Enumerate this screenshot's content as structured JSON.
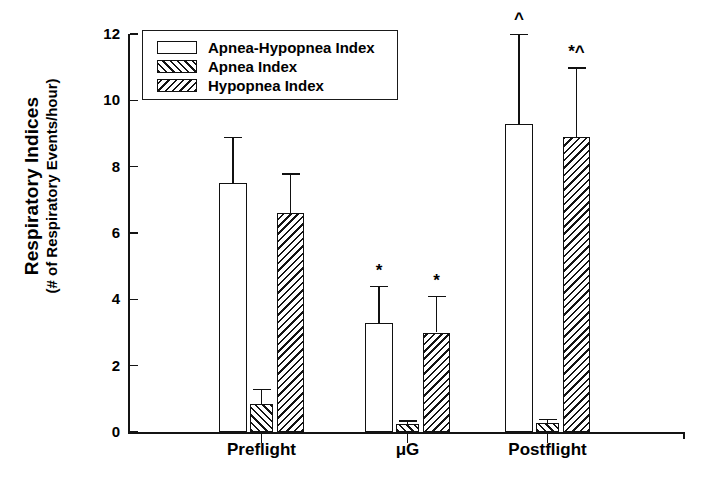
{
  "chart_data": {
    "type": "bar",
    "title": "",
    "xlabel": "",
    "ylabel": "Respiratory Indices",
    "ylabel_sub": "(# of Respiratory Events/hour)",
    "categories": [
      "Preflight",
      "μG",
      "Postflight"
    ],
    "ylim": [
      0,
      12
    ],
    "yticks": [
      0,
      2,
      4,
      6,
      8,
      10,
      12
    ],
    "grid": false,
    "legend_position": "top-left",
    "series": [
      {
        "name": "Apnea-Hypopnea Index",
        "pattern": "none",
        "values": [
          7.5,
          3.3,
          9.3
        ],
        "errors": [
          1.4,
          1.1,
          2.7
        ],
        "annotations": [
          "",
          "*",
          "^"
        ]
      },
      {
        "name": "Apnea Index",
        "pattern": "forward-hatch",
        "values": [
          0.85,
          0.25,
          0.28
        ],
        "errors": [
          0.45,
          0.1,
          0.12
        ],
        "annotations": [
          "",
          "",
          ""
        ]
      },
      {
        "name": "Hypopnea Index",
        "pattern": "back-hatch",
        "values": [
          6.6,
          3.0,
          8.9
        ],
        "errors": [
          1.2,
          1.1,
          2.1
        ],
        "annotations": [
          "",
          "*",
          "*^"
        ]
      }
    ]
  },
  "axis": {
    "ytick_labels": [
      "0",
      "2",
      "4",
      "6",
      "8",
      "10",
      "12"
    ]
  },
  "legend": {
    "entries": [
      {
        "label": "Apnea-Hypopnea Index",
        "pattern": "none"
      },
      {
        "label": "Apnea Index",
        "pattern": "forward-hatch"
      },
      {
        "label": "Hypopnea Index",
        "pattern": "back-hatch"
      }
    ]
  },
  "colors": {
    "ink": "#141414",
    "background": "#ffffff"
  }
}
